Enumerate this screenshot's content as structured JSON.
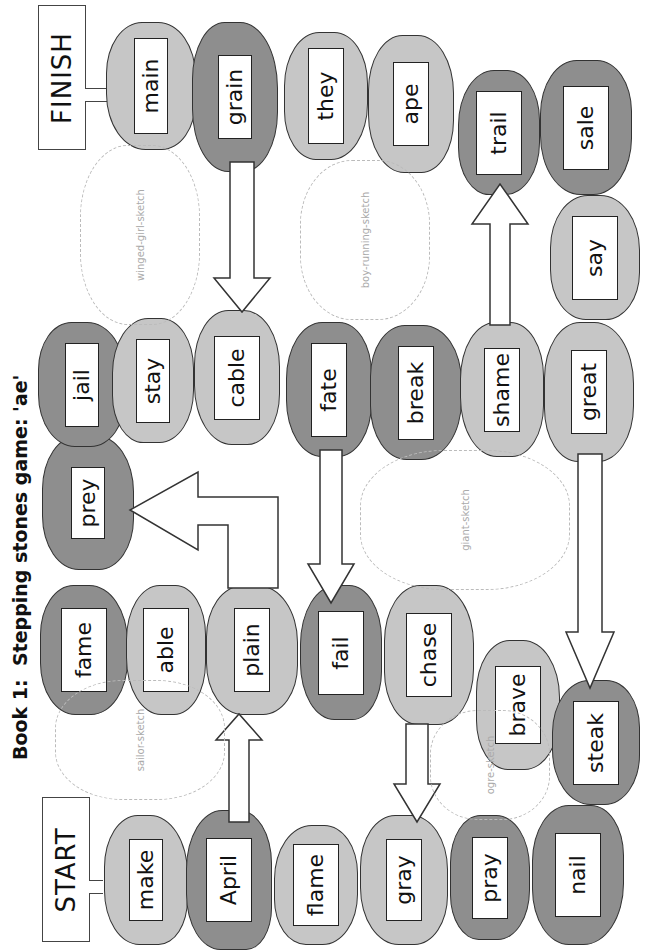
{
  "title": "Book 1:  Stepping stones game: 'ae'",
  "signs": {
    "start": "START",
    "finish": "FINISH"
  },
  "colors": {
    "light_stone": "#c6c6c6",
    "dark_stone": "#8e8e8e",
    "outline": "#333333",
    "background": "#ffffff"
  },
  "stones": [
    {
      "word": "make",
      "shade": "light"
    },
    {
      "word": "April",
      "shade": "dark"
    },
    {
      "word": "flame",
      "shade": "light"
    },
    {
      "word": "gray",
      "shade": "light"
    },
    {
      "word": "pray",
      "shade": "dark"
    },
    {
      "word": "nail",
      "shade": "dark"
    },
    {
      "word": "fame",
      "shade": "dark"
    },
    {
      "word": "able",
      "shade": "light"
    },
    {
      "word": "plain",
      "shade": "light"
    },
    {
      "word": "fail",
      "shade": "dark"
    },
    {
      "word": "chase",
      "shade": "light"
    },
    {
      "word": "brave",
      "shade": "light"
    },
    {
      "word": "steak",
      "shade": "light"
    },
    {
      "word": "prey",
      "shade": "dark"
    },
    {
      "word": "jail",
      "shade": "dark"
    },
    {
      "word": "stay",
      "shade": "light"
    },
    {
      "word": "cable",
      "shade": "light"
    },
    {
      "word": "fate",
      "shade": "light"
    },
    {
      "word": "break",
      "shade": "dark"
    },
    {
      "word": "shame",
      "shade": "dark"
    },
    {
      "word": "great",
      "shade": "dark"
    },
    {
      "word": "main",
      "shade": "light"
    },
    {
      "word": "grain",
      "shade": "light"
    },
    {
      "word": "they",
      "shade": "dark"
    },
    {
      "word": "ape",
      "shade": "dark"
    },
    {
      "word": "trail",
      "shade": "dark"
    },
    {
      "word": "sale",
      "shade": "light"
    },
    {
      "word": "say",
      "shade": "light"
    }
  ],
  "arrows": [
    {
      "from": "April",
      "to": "flame"
    },
    {
      "from": "flame",
      "to": "nail"
    },
    {
      "from": "fail",
      "to": "plain"
    },
    {
      "from": "shame",
      "to": "great"
    },
    {
      "from": "main",
      "to": "sale"
    },
    {
      "from": "fate",
      "to": "prey"
    },
    {
      "from": "cable",
      "to": "they"
    }
  ],
  "illustrations": [
    "winged-girl-sketch",
    "boy-running-sketch",
    "giant-sketch",
    "sailor-sketch",
    "ogre-sketch"
  ]
}
